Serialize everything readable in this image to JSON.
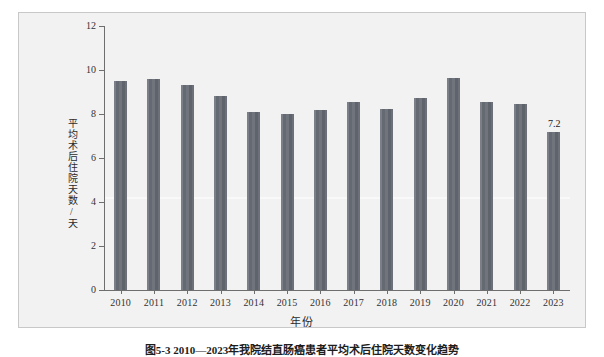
{
  "figure": {
    "caption": "图5-3  2010—2023年我院结直肠癌患者平均术后住院天数变化趋势"
  },
  "chart_data": {
    "type": "bar",
    "title": "",
    "xlabel": "年份",
    "ylabel": "平均术后住院天数/天",
    "categories": [
      "2010",
      "2011",
      "2012",
      "2013",
      "2014",
      "2015",
      "2016",
      "2017",
      "2018",
      "2019",
      "2020",
      "2021",
      "2022",
      "2023"
    ],
    "values": [
      9.5,
      9.6,
      9.3,
      8.8,
      8.1,
      8.0,
      8.2,
      8.55,
      8.25,
      8.75,
      9.65,
      8.55,
      8.45,
      7.2
    ],
    "value_labels": [
      "",
      "",
      "",
      "",
      "",
      "",
      "",
      "",
      "",
      "",
      "",
      "",
      "",
      "7.2"
    ],
    "ylim": [
      0,
      12
    ],
    "yticks": [
      "0",
      "2",
      "4",
      "6",
      "8",
      "10",
      "12"
    ],
    "ytick_values": [
      0,
      2,
      4,
      6,
      8,
      10,
      12
    ],
    "grid": false,
    "legend": "none",
    "bar_color": "#6b6f76",
    "plot_background": "#f2f2f2",
    "axis_color": "#6e6e6e"
  }
}
